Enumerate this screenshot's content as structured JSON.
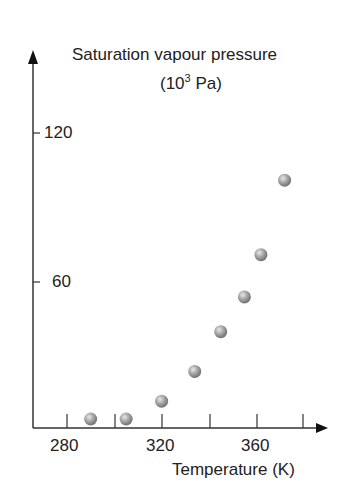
{
  "chart_data": {
    "type": "scatter",
    "title": "",
    "ylabel": "Saturation vapour pressure",
    "ylabel_unit": "(10^3 Pa)",
    "xlabel": "Temperature (K)",
    "x_ticks": [
      280,
      300,
      320,
      340,
      360,
      380
    ],
    "x_tick_labels": [
      "280",
      "320",
      "360"
    ],
    "y_tick_labels": [
      "120",
      "60"
    ],
    "y_ticks": [
      60,
      120
    ],
    "xlim": [
      266,
      390
    ],
    "ylim": [
      0,
      140
    ],
    "grid": false,
    "legend": null,
    "x": [
      290,
      305,
      320,
      334,
      345,
      355,
      362,
      372
    ],
    "y": [
      3,
      3,
      12,
      24,
      40,
      54,
      71,
      101
    ],
    "marker": "sphere",
    "marker_color": "#8c8c8c"
  },
  "labels": {
    "y_title_line1": "Saturation vapour pressure",
    "y_title_line2_pre": "(10",
    "y_title_sup": "3",
    "y_title_line2_post": " Pa)",
    "x_title": "Temperature (K)",
    "y120": "120",
    "y60": "60",
    "x280": "280",
    "x320": "320",
    "x360": "360"
  }
}
